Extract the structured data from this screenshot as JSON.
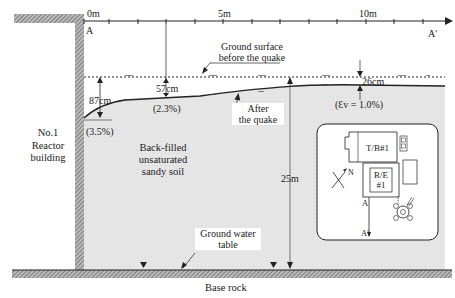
{
  "axis": {
    "ticks": [
      "0m",
      "5m",
      "10m"
    ],
    "start_label": "A",
    "end_label": "A'"
  },
  "building": {
    "line1": "No.1",
    "line2": "Reactor",
    "line3": "building"
  },
  "ground_before": {
    "line1": "Ground surface",
    "line2": "before the quake"
  },
  "ground_after": {
    "line1": "After",
    "line2": "the quake"
  },
  "settlements": [
    {
      "value": "87cm",
      "strain": "(3.5%)"
    },
    {
      "value": "57cm",
      "strain": "(2.3%)"
    },
    {
      "value": "26cm",
      "strain": "(Ɛv = 1.0%)"
    }
  ],
  "soil": {
    "line1": "Back-filled",
    "line2": "unsaturated",
    "line3": "sandy soil"
  },
  "depth": "25m",
  "water_table": {
    "line1": "Ground water",
    "line2": "table"
  },
  "base_rock": "Base rock",
  "grass_symbol": "ᴖᴖᴖ",
  "inset": {
    "turbine": "T/B#1",
    "reactor_line1": "R/E",
    "reactor_line2": "#1",
    "north": "N",
    "section_start": "A",
    "section_end": "A'"
  },
  "colors": {
    "soil": "#e4e4e4",
    "line": "#222222",
    "hatch": "#777777"
  }
}
